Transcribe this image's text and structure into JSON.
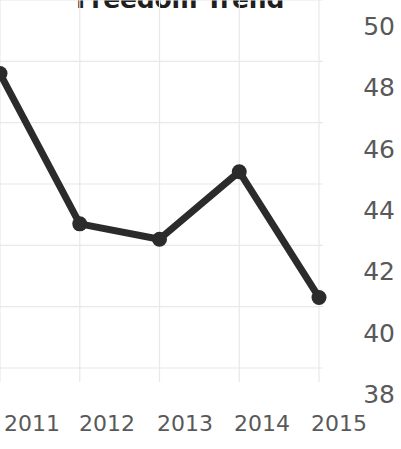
{
  "chart_data": {
    "type": "line",
    "title": "Freedom Trend",
    "xlabel": "",
    "ylabel": "",
    "categories": [
      "2011",
      "2012",
      "2013",
      "2014",
      "2015"
    ],
    "x": [
      2011,
      2012,
      2013,
      2014,
      2015
    ],
    "values": [
      47.6,
      42.7,
      42.2,
      44.4,
      40.3
    ],
    "series": [
      {
        "name": "Freedom Trend",
        "values": [
          47.6,
          42.7,
          42.2,
          44.4,
          40.3
        ]
      }
    ],
    "ylim": [
      38,
      50
    ],
    "yticks": [
      50,
      48,
      46,
      44,
      42,
      40,
      38
    ],
    "ytick_labels": [
      "50",
      "48",
      "46",
      "44",
      "42",
      "40",
      "38"
    ],
    "xtick_labels": [
      "2011",
      "2012",
      "2013",
      "2014",
      "2015"
    ],
    "y_axis_position": "right",
    "grid": true,
    "grid_color": "#e8e8e8",
    "legend": false,
    "legend_position": "none",
    "line_color": "#2b2b2b",
    "marker": "circle",
    "marker_color": "#2b2b2b",
    "label_color": "#595959",
    "title_color": "#1f1f1f",
    "background": "#ffffff"
  }
}
